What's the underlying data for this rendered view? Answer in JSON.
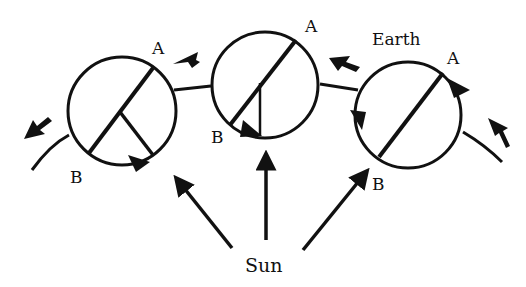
{
  "diagram": {
    "labels": {
      "earth": "Earth",
      "sun": "Sun",
      "left_a": "A",
      "left_b": "B",
      "mid_a": "A",
      "mid_b": "B",
      "right_a": "A",
      "right_b": "B"
    },
    "colors": {
      "stroke": "#111111",
      "background": "#ffffff"
    }
  }
}
